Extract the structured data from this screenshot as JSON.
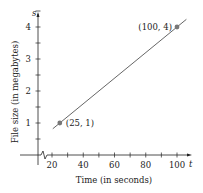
{
  "chart_data": {
    "type": "line",
    "title": "",
    "xlabel": "Time (in seconds)",
    "ylabel": "File size (in megabytes)",
    "x_axis_var": "t",
    "y_axis_var": "s",
    "x_ticks": [
      20,
      40,
      60,
      80,
      100
    ],
    "y_ticks": [
      1,
      2,
      3,
      4
    ],
    "xlim": [
      0,
      105
    ],
    "ylim": [
      0,
      5
    ],
    "grid": false,
    "axis_break_x": true,
    "series": [
      {
        "name": "File size",
        "x": [
          25,
          100
        ],
        "y": [
          1,
          4
        ]
      }
    ],
    "annotations": [
      {
        "text": "(25, 1)",
        "x": 25,
        "y": 1
      },
      {
        "text": "(100, 4)",
        "x": 100,
        "y": 4
      }
    ]
  }
}
